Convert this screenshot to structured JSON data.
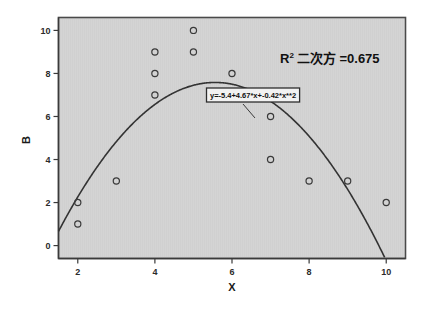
{
  "chart_data": {
    "type": "scatter",
    "title": "",
    "xlabel": "X",
    "ylabel": "B",
    "xlim": [
      1.5,
      10.5
    ],
    "ylim": [
      -0.6,
      10.6
    ],
    "xticks": [
      "2",
      "4",
      "6",
      "8",
      "10"
    ],
    "xtick_values": [
      2,
      4,
      6,
      8,
      10
    ],
    "yticks": [
      "0",
      "2",
      "4",
      "6",
      "8",
      "10"
    ],
    "ytick_values": [
      0,
      2,
      4,
      6,
      8,
      10
    ],
    "grid": false,
    "legend": "none",
    "points": [
      {
        "x": 2,
        "y": 1
      },
      {
        "x": 2,
        "y": 2
      },
      {
        "x": 3,
        "y": 3
      },
      {
        "x": 4,
        "y": 7
      },
      {
        "x": 4,
        "y": 8
      },
      {
        "x": 4,
        "y": 9
      },
      {
        "x": 5,
        "y": 9
      },
      {
        "x": 5,
        "y": 10
      },
      {
        "x": 6,
        "y": 8
      },
      {
        "x": 7,
        "y": 4
      },
      {
        "x": 7,
        "y": 6
      },
      {
        "x": 8,
        "y": 3
      },
      {
        "x": 9,
        "y": 3
      },
      {
        "x": 10,
        "y": 2
      }
    ],
    "fit": {
      "type": "quadratic",
      "equation_label": "y=-5.4+4.67*x+-0.42*x**2",
      "intercept": -5.4,
      "linear_coef": 4.67,
      "quadratic_coef": -0.42
    },
    "annotations": {
      "r2_symbol": "R",
      "r2_superscript": "2",
      "r2_label": "二次方 =0.675",
      "r2_value": 0.675
    },
    "colors": {
      "plot_background": "#d4d4d4",
      "page_background": "#ffffff",
      "marker_stroke": "#3a3a3a",
      "curve": "#333333",
      "frame": "#4a4a4a",
      "text": "#111111"
    }
  }
}
